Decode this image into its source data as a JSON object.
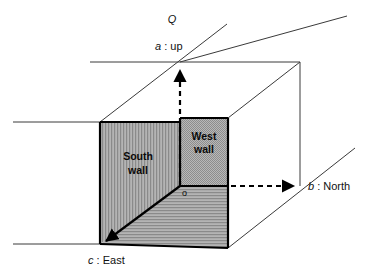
{
  "figure": {
    "title_symbol": "Q",
    "axes": [
      {
        "key": "a",
        "symbol": "a",
        "separator": " : ",
        "name": "up",
        "full": "a : up"
      },
      {
        "key": "b",
        "symbol": "b",
        "separator": " : ",
        "name": "North",
        "full": "b : North"
      },
      {
        "key": "c",
        "symbol": "c",
        "separator": " : ",
        "name": "East",
        "full": "c : East"
      }
    ],
    "origin_label": "o",
    "faces": [
      {
        "key": "south",
        "line1": "South",
        "line2": "wall",
        "texture": "vertical-stripes"
      },
      {
        "key": "west",
        "line1": "West",
        "line2": "wall",
        "texture": "fine-dots"
      },
      {
        "key": "floor",
        "line1": "",
        "line2": "",
        "texture": "horizontal-stripes"
      }
    ],
    "colors": {
      "background": "#ffffff",
      "ink": "#000000",
      "thin_line": "#3a3a3a",
      "shade": "#a8a8a8"
    }
  }
}
